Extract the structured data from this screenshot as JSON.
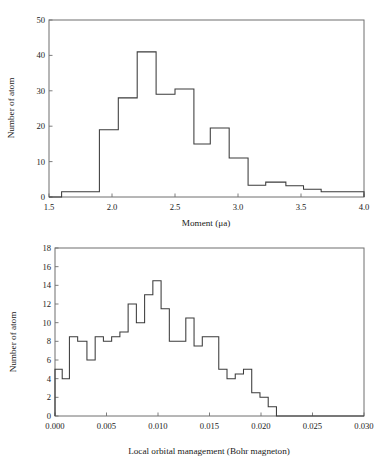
{
  "page": {
    "background": "#ffffff",
    "line_color": "#3b3b3b",
    "frame_color": "#6f6f6f",
    "text_color": "#1a1a1a"
  },
  "chart_data": [
    {
      "id": "moment-histogram",
      "type": "bar",
      "title": "",
      "xlabel": "Moment (μa)",
      "ylabel": "Number of atom",
      "xlim": [
        1.5,
        4.0
      ],
      "ylim": [
        0,
        50
      ],
      "grid": false,
      "legend": null,
      "xticks": [
        1.5,
        2.0,
        2.5,
        3.0,
        3.5,
        4.0
      ],
      "xtick_labels": [
        "1.5",
        "2.0",
        "2.5",
        "3.0",
        "3.5",
        "4.0"
      ],
      "yticks": [
        0,
        10,
        20,
        30,
        40,
        50
      ],
      "ytick_labels": [
        "0",
        "10",
        "20",
        "30",
        "40",
        "50"
      ],
      "bin_edges": [
        1.5,
        1.6,
        1.9,
        2.05,
        2.2,
        2.35,
        2.5,
        2.65,
        2.78,
        2.93,
        3.08,
        3.22,
        3.38,
        3.52,
        3.66,
        3.8,
        4.0
      ],
      "values": [
        0,
        1.5,
        19,
        28,
        41,
        29,
        30.5,
        15,
        19.5,
        11,
        3.3,
        4.2,
        3.2,
        2.2,
        1.5,
        1.5
      ]
    },
    {
      "id": "local-orbital-histogram",
      "type": "bar",
      "title": "",
      "xlabel": "Local orbital management (Bohr magneton)",
      "ylabel": "Number of atom",
      "xlim": [
        0.0,
        0.03
      ],
      "ylim": [
        0,
        18
      ],
      "grid": false,
      "legend": null,
      "xticks": [
        0.0,
        0.005,
        0.01,
        0.015,
        0.02,
        0.025,
        0.03
      ],
      "xtick_labels": [
        "0.000",
        "0.005",
        "0.010",
        "0.015",
        "0.020",
        "0.025",
        "0.030"
      ],
      "yticks": [
        0,
        2,
        4,
        6,
        8,
        10,
        12,
        14,
        16,
        18
      ],
      "ytick_labels": [
        "0",
        "2",
        "4",
        "6",
        "8",
        "10",
        "12",
        "14",
        "16",
        "18"
      ],
      "bin_edges": [
        0.0,
        0.0007,
        0.0014,
        0.0022,
        0.0031,
        0.0039,
        0.0047,
        0.0055,
        0.0063,
        0.0071,
        0.0079,
        0.0087,
        0.0095,
        0.0103,
        0.0111,
        0.0119,
        0.0127,
        0.0135,
        0.0143,
        0.0151,
        0.0159,
        0.0167,
        0.0175,
        0.0183,
        0.0191,
        0.0199,
        0.0207,
        0.0215,
        0.0222,
        0.023,
        0.0238,
        0.0246,
        0.0254,
        0.0262,
        0.027,
        0.03
      ],
      "values": [
        5,
        4,
        8.5,
        8,
        6,
        8.5,
        8,
        8.5,
        9,
        12,
        10,
        13,
        14.5,
        11.5,
        8,
        8,
        10.5,
        7.5,
        8.5,
        8.5,
        5,
        4,
        4.5,
        5,
        2.5,
        2,
        1,
        0,
        0,
        0,
        0,
        0,
        0,
        0,
        0
      ]
    }
  ]
}
